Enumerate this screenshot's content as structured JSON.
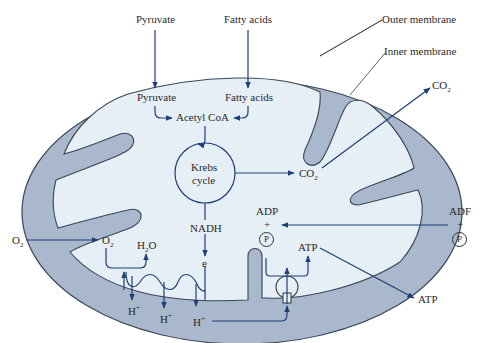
{
  "diagram": {
    "type": "mitochondrion-cellular-respiration",
    "colors": {
      "outer_compartment": "#a9b8cc",
      "matrix": "#e6eef6",
      "membrane_stroke": "#3a4656",
      "arrow": "#1e3f78",
      "leader_line": "#3a3a3a",
      "text": "#2a2a2a"
    },
    "labels": {
      "outer_membrane": "Outer membrane",
      "inner_membrane": "Inner membrane",
      "pyruvate_outside": "Pyruvate",
      "fatty_acids_outside": "Fatty acids",
      "pyruvate_inside": "Pyruvate",
      "fatty_acids_inside": "Fatty acids",
      "acetyl_coa": "Acetyl CoA",
      "krebs_line1": "Krebs",
      "krebs_line2": "cycle",
      "co2_inside": "CO",
      "co2_inside_sub": "2",
      "co2_outside": "CO",
      "co2_outside_sub": "2",
      "nadh": "NADH",
      "e": "e",
      "o2_outside": "O",
      "o2_outside_sub": "2",
      "o2_inside": "O",
      "o2_inside_sub": "2",
      "h2o_h": "H",
      "h2o_sub": "2",
      "h2o_o": "O",
      "h_plus_1": "H",
      "h_plus_2": "H",
      "h_plus_3": "H",
      "plus_sup": "+",
      "adp_inside": "ADP",
      "plus_inside": "+",
      "p_inside": "P",
      "atp_inside": "ATP",
      "adp_outside": "ADF",
      "plus_outside": "+",
      "p_outside": "P",
      "atp_outside": "ATP"
    }
  }
}
